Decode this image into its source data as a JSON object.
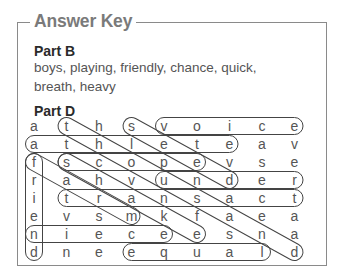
{
  "answer_key": {
    "title": "Answer Key",
    "part_b": {
      "heading": "Part B",
      "line1": "boys, playing, friendly, chance, quick,",
      "line2": "breath, heavy"
    },
    "part_d": {
      "heading": "Part D",
      "grid": [
        [
          "a",
          "t",
          "h",
          "s",
          "v",
          "o",
          "i",
          "c",
          "e"
        ],
        [
          "a",
          "t",
          "h",
          "l",
          "e",
          "t",
          "e",
          "a",
          "v"
        ],
        [
          "f",
          "s",
          "c",
          "o",
          "p",
          "e",
          "v",
          "s",
          "e"
        ],
        [
          "r",
          "a",
          "h",
          "v",
          "u",
          "n",
          "d",
          "e",
          "r"
        ],
        [
          "i",
          "t",
          "r",
          "a",
          "n",
          "s",
          "a",
          "c",
          "t"
        ],
        [
          "e",
          "v",
          "s",
          "m",
          "k",
          "f",
          "a",
          "e",
          "a"
        ],
        [
          "n",
          "i",
          "e",
          "c",
          "e",
          "e",
          "s",
          "n",
          "a"
        ],
        [
          "d",
          "n",
          "e",
          "e",
          "q",
          "u",
          "a",
          "l",
          "d"
        ]
      ],
      "found_words": [
        {
          "word": "voice",
          "direction": "horizontal",
          "start": [
            0,
            4
          ],
          "end": [
            0,
            8
          ]
        },
        {
          "word": "athlete",
          "direction": "horizontal",
          "start": [
            1,
            0
          ],
          "end": [
            1,
            6
          ]
        },
        {
          "word": "scope",
          "direction": "horizontal",
          "start": [
            2,
            1
          ],
          "end": [
            2,
            5
          ]
        },
        {
          "word": "under",
          "direction": "horizontal",
          "start": [
            3,
            4
          ],
          "end": [
            3,
            8
          ]
        },
        {
          "word": "transact",
          "direction": "horizontal",
          "start": [
            4,
            1
          ],
          "end": [
            4,
            8
          ]
        },
        {
          "word": "niece",
          "direction": "horizontal",
          "start": [
            6,
            0
          ],
          "end": [
            6,
            4
          ]
        },
        {
          "word": "equal",
          "direction": "horizontal",
          "start": [
            7,
            3
          ],
          "end": [
            7,
            7
          ]
        },
        {
          "word": "friend",
          "direction": "vertical",
          "start": [
            2,
            0
          ],
          "end": [
            7,
            0
          ]
        },
        {
          "word": "seed",
          "direction": "diagonal",
          "start": [
            0,
            3
          ],
          "end": [
            3,
            6
          ]
        },
        {
          "word": "thousand",
          "direction": "diagonal",
          "start": [
            0,
            1
          ],
          "end": [
            7,
            8
          ]
        },
        {
          "word": "farm",
          "direction": "diagonal",
          "start": [
            2,
            0
          ],
          "end": [
            5,
            3
          ]
        },
        {
          "word": "shake",
          "direction": "diagonal",
          "start": [
            2,
            1
          ],
          "end": [
            6,
            5
          ]
        }
      ]
    }
  }
}
